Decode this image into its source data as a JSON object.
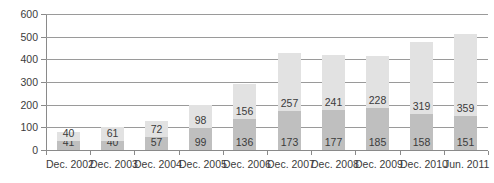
{
  "chart_data": {
    "type": "bar",
    "stacked": true,
    "title": "",
    "subtitle": "",
    "xlabel": "",
    "ylabel": "",
    "grid": true,
    "legend": "none",
    "ylim": [
      0,
      600
    ],
    "yticks": [
      0,
      100,
      200,
      300,
      400,
      500,
      600
    ],
    "ytick_labels": [
      "0",
      "100",
      "200",
      "300",
      "400",
      "500",
      "600"
    ],
    "categories": [
      "Dec. 2002",
      "Dec. 2003",
      "Dec. 2004",
      "Dec. 2005",
      "Dec. 2006",
      "Dec. 2007",
      "Dec. 2008",
      "Dec. 2009",
      "Dec. 2010",
      "Jun. 2011"
    ],
    "series": [
      {
        "name": "lower-segment",
        "color": "#bfbfbf",
        "values": [
          41,
          40,
          57,
          99,
          136,
          173,
          177,
          185,
          158,
          151
        ]
      },
      {
        "name": "upper-segment",
        "color": "#e2e2e2",
        "values": [
          40,
          61,
          72,
          98,
          156,
          257,
          241,
          228,
          319,
          359
        ]
      }
    ],
    "totals": [
      81,
      101,
      129,
      197,
      292,
      430,
      418,
      413,
      477,
      510
    ],
    "data_labels": {
      "lower": [
        "41",
        "40",
        "57",
        "99",
        "136",
        "173",
        "177",
        "185",
        "158",
        "151"
      ],
      "upper": [
        "40",
        "61",
        "72",
        "98",
        "156",
        "257",
        "241",
        "228",
        "319",
        "359"
      ]
    }
  },
  "colors": {
    "lower_segment": "#bfbfbf",
    "upper_segment": "#e2e2e2",
    "gridline": "#9a9a9a",
    "axis": "#8a8a8a",
    "text": "#3b3b3b",
    "background": "#ffffff"
  }
}
